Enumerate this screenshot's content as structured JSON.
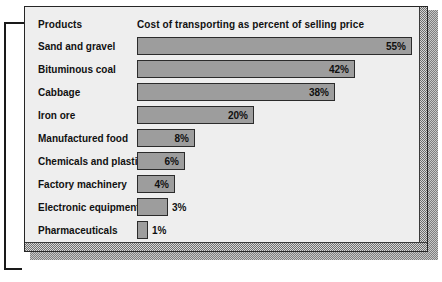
{
  "chart_data": {
    "type": "bar",
    "orientation": "horizontal",
    "title": "",
    "column_headers": [
      "Products",
      "Cost of transporting as percent of selling price"
    ],
    "categories": [
      "Sand and gravel",
      "Bituminous coal",
      "Cabbage",
      "Iron ore",
      "Manufactured food",
      "Chemicals and plastics",
      "Factory machinery",
      "Electronic equipment",
      "Pharmaceuticals"
    ],
    "values": [
      55,
      42,
      38,
      20,
      8,
      6,
      4,
      3,
      1
    ],
    "value_labels": [
      "55%",
      "42%",
      "38%",
      "20%",
      "8%",
      "6%",
      "4%",
      "3%",
      "1%"
    ],
    "xlabel": "",
    "ylabel": "Products",
    "xlim": [
      0,
      55
    ],
    "grid": false,
    "legend": false,
    "unit": "%"
  },
  "panel": {
    "header": {
      "products_label": "Products",
      "metric_label": "Cost of transporting as percent of selling price"
    },
    "rows": [
      {
        "label": "Sand and gravel",
        "value_label": "55%",
        "bar_px": 275,
        "label_inside": true
      },
      {
        "label": "Bituminous coal",
        "value_label": "42%",
        "bar_px": 218,
        "label_inside": true
      },
      {
        "label": "Cabbage",
        "value_label": "38%",
        "bar_px": 198,
        "label_inside": true
      },
      {
        "label": "Iron ore",
        "value_label": "20%",
        "bar_px": 117,
        "label_inside": true
      },
      {
        "label": "Manufactured food",
        "value_label": "8%",
        "bar_px": 58,
        "label_inside": true
      },
      {
        "label": "Chemicals and plastics",
        "value_label": "6%",
        "bar_px": 48,
        "label_inside": true
      },
      {
        "label": "Factory machinery",
        "value_label": "4%",
        "bar_px": 38,
        "label_inside": true
      },
      {
        "label": "Electronic equipment",
        "value_label": "3%",
        "bar_px": 31,
        "label_inside": false
      },
      {
        "label": "Pharmaceuticals",
        "value_label": "1%",
        "bar_px": 11,
        "label_inside": false
      }
    ]
  },
  "colors": {
    "bar_fill": "#9d9d9d",
    "bar_border": "#2b2b2b",
    "panel_background": "#eeeeee",
    "panel_border": "#262626",
    "text": "#111111",
    "page_background": "#ffffff",
    "bracket": "#1a1a1a"
  }
}
